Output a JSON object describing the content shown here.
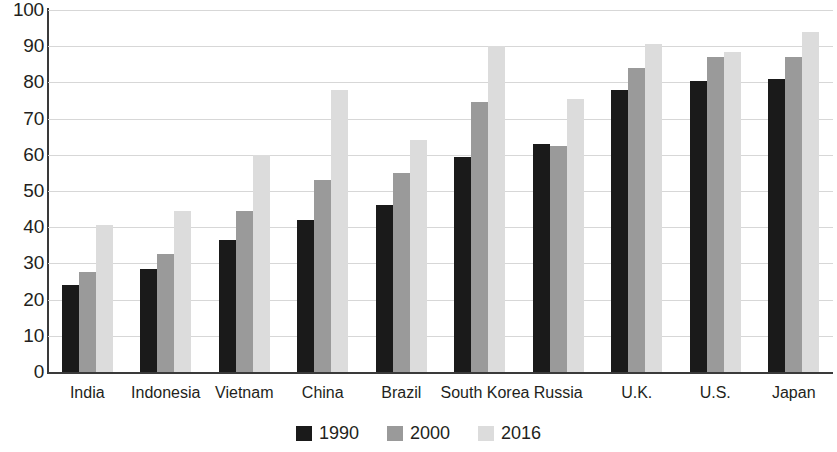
{
  "chart_data": {
    "type": "bar",
    "title": "",
    "xlabel": "",
    "ylabel": "",
    "ylim": [
      0,
      100
    ],
    "ytick_step": 10,
    "yticks": [
      "100",
      "90",
      "80",
      "70",
      "60",
      "50",
      "40",
      "30",
      "20",
      "10",
      "0"
    ],
    "grid": true,
    "legend_position": "bottom-center",
    "categories": [
      "India",
      "Indonesia",
      "Vietnam",
      "China",
      "Brazil",
      "South Korea",
      "Russia",
      "U.K.",
      "U.S.",
      "Japan"
    ],
    "series": [
      {
        "name": "1990",
        "color": "#1a1a1a",
        "values": [
          24,
          28.5,
          36.5,
          42,
          46,
          59.5,
          63,
          78,
          80.5,
          81
        ]
      },
      {
        "name": "2000",
        "color": "#9a9a9a",
        "values": [
          27.5,
          32.5,
          44.5,
          53,
          55,
          74.5,
          62.5,
          84,
          87,
          87
        ]
      },
      {
        "name": "2016",
        "color": "#dcdcdc",
        "values": [
          40.5,
          44.5,
          60,
          78,
          64,
          90,
          75.5,
          90.5,
          88.5,
          94
        ]
      }
    ]
  }
}
